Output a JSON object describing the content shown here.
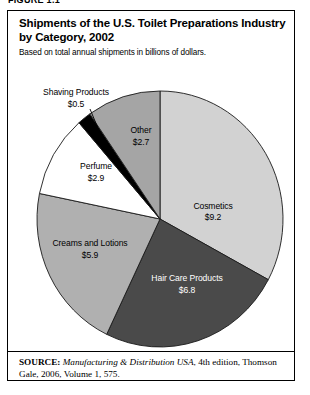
{
  "figure": {
    "label": "FIGURE 1.1",
    "title": "Shipments of the U.S. Toilet Preparations Industry by Category, 2002",
    "subtitle": "Based on total annual shipments in billions of dollars.",
    "source_label": "SOURCE:",
    "source_title": "Manufacturing & Distribution USA",
    "source_rest": ", 4th edition, Thomson Gale, 2006, Volume 1, 575."
  },
  "chart_data": {
    "type": "pie",
    "title": "Shipments of the U.S. Toilet Preparations Industry by Category, 2002",
    "subtitle": "Based on total annual shipments in billions of dollars.",
    "unit": "billions of dollars",
    "total": 28.0,
    "start_angle_deg": 0,
    "direction": "clockwise",
    "grid": false,
    "legend": "none",
    "labels_position": "inside-and-callout",
    "categories": [
      "Cosmetics",
      "Hair Care Products",
      "Creams and Lotions",
      "Perfume",
      "Shaving Products",
      "Other"
    ],
    "values": [
      9.2,
      6.8,
      5.9,
      2.9,
      0.5,
      2.7
    ],
    "value_labels": [
      "$9.2",
      "$6.8",
      "$5.9",
      "$2.9",
      "$0.5",
      "$2.7"
    ],
    "colors": [
      "#d2d2d2",
      "#4a4a4a",
      "#b0b0b0",
      "#ffffff",
      "#000000",
      "#a5a5a5"
    ],
    "slices": [
      {
        "name": "Cosmetics",
        "value": 9.2,
        "value_label": "$9.2",
        "color": "#d2d2d2",
        "label_color": "#000000",
        "percent": 32.9,
        "start_deg": 0,
        "end_deg": 118.3,
        "label_x": 205,
        "label_y": 198,
        "value_x": 205,
        "value_y": 209
      },
      {
        "name": "Hair Care Products",
        "value": 6.8,
        "value_label": "$6.8",
        "color": "#4a4a4a",
        "label_color": "#ffffff",
        "percent": 24.3,
        "start_deg": 118.3,
        "end_deg": 205.7,
        "label_x": 179,
        "label_y": 270,
        "value_x": 179,
        "value_y": 282
      },
      {
        "name": "Creams and Lotions",
        "value": 5.9,
        "value_label": "$5.9",
        "color": "#b0b0b0",
        "label_color": "#000000",
        "percent": 21.1,
        "start_deg": 205.7,
        "end_deg": 281.5,
        "label_x": 82,
        "label_y": 235,
        "value_x": 82,
        "value_y": 247
      },
      {
        "name": "Perfume",
        "value": 2.9,
        "value_label": "$2.9",
        "color": "#ffffff",
        "label_color": "#000000",
        "percent": 10.4,
        "start_deg": 281.5,
        "end_deg": 318.8,
        "label_x": 88,
        "label_y": 158,
        "value_x": 88,
        "value_y": 170
      },
      {
        "name": "Shaving Products",
        "value": 0.5,
        "value_label": "$0.5",
        "color": "#000000",
        "label_color": "#000000",
        "percent": 1.8,
        "start_deg": 318.8,
        "end_deg": 325.2,
        "label_x": 68,
        "label_y": 84,
        "value_x": 68,
        "value_y": 96,
        "callout": true
      },
      {
        "name": "Other",
        "value": 2.7,
        "value_label": "$2.7",
        "color": "#a5a5a5",
        "label_color": "#000000",
        "percent": 9.6,
        "start_deg": 325.2,
        "end_deg": 360,
        "label_x": 133,
        "label_y": 122,
        "value_x": 133,
        "value_y": 134
      }
    ]
  }
}
